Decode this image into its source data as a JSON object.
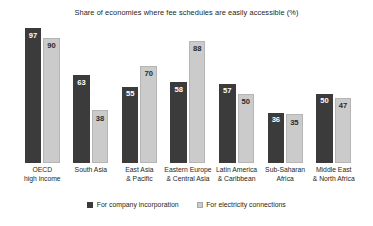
{
  "chart_data": {
    "type": "bar",
    "title": "Share of economies where fee schedules are easily accessible (%)",
    "xlabel": "",
    "ylabel": "",
    "ylim": [
      0,
      100
    ],
    "grid": false,
    "legend_position": "bottom-center",
    "categories": [
      "OECD high income",
      "South Asia",
      "East Asia & Pacific",
      "Eastern Europe & Central Asia",
      "Latin America & Caribbean",
      "Sub-Saharan Africa",
      "Middle East & North Africa"
    ],
    "category_lines": [
      [
        "OECD",
        "high income"
      ],
      [
        "South Asia"
      ],
      [
        "East Asia",
        "& Pacific"
      ],
      [
        "Eastern Europe",
        "& Central Asia"
      ],
      [
        "Latin America",
        "& Caribbean"
      ],
      [
        "Sub-Saharan",
        "Africa"
      ],
      [
        "Middle East",
        "& North Africa"
      ]
    ],
    "series": [
      {
        "name": "For company incorporation",
        "color": "#3b3b3b",
        "values": [
          97,
          63,
          55,
          58,
          57,
          36,
          50
        ]
      },
      {
        "name": "For electricity connections",
        "color": "#cbcbcb",
        "values": [
          90,
          38,
          70,
          88,
          50,
          35,
          47
        ]
      }
    ]
  },
  "legend": {
    "items": [
      {
        "label": "For company incorporation",
        "style": "dark"
      },
      {
        "label": "For electricity connections",
        "style": "light"
      }
    ]
  }
}
